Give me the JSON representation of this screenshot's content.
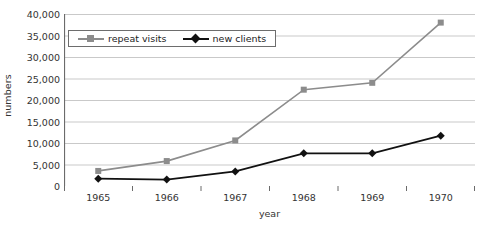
{
  "chart_data": {
    "type": "line",
    "title": "",
    "xlabel": "year",
    "ylabel": "numbers",
    "categories": [
      "1965",
      "1966",
      "1967",
      "1968",
      "1969",
      "1970"
    ],
    "ylim": [
      0,
      40000
    ],
    "ytick_labels": [
      "0",
      "5,000",
      "10,000",
      "15,000",
      "20,000",
      "25,000",
      "30,000",
      "35,000",
      "40,000"
    ],
    "ytick_values": [
      0,
      5000,
      10000,
      15000,
      20000,
      25000,
      30000,
      35000,
      40000
    ],
    "grid": "horizontal",
    "legend_position": "top-left-inside",
    "series": [
      {
        "name": "repeat visits",
        "color": "#8c8c8c",
        "marker": "square",
        "values": [
          3500,
          5800,
          10600,
          22400,
          24000,
          38000
        ]
      },
      {
        "name": "new clients",
        "color": "#111111",
        "marker": "diamond",
        "values": [
          1700,
          1500,
          3400,
          7600,
          7600,
          11700
        ]
      }
    ]
  },
  "axis": {
    "y_title": "numbers",
    "x_title": "year"
  }
}
